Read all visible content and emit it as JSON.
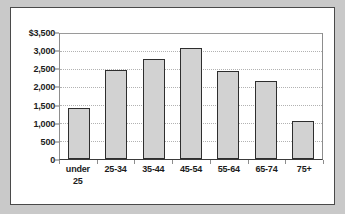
{
  "chart_data": {
    "type": "bar",
    "title": "",
    "subtitle": "",
    "xlabel": "",
    "ylabel": "",
    "categories": [
      "under 25",
      "25-34",
      "35-44",
      "45-54",
      "55-64",
      "65-74",
      "75+"
    ],
    "category_lines": [
      [
        "under",
        "25"
      ],
      [
        "25-34"
      ],
      [
        "35-44"
      ],
      [
        "45-54"
      ],
      [
        "55-64"
      ],
      [
        "65-74"
      ],
      [
        "75+"
      ]
    ],
    "values": [
      1400,
      2450,
      2750,
      3050,
      2425,
      2150,
      1050
    ],
    "ylim": [
      0,
      3500
    ],
    "ytick_values": [
      0,
      500,
      1000,
      1500,
      2000,
      2500,
      3000,
      3500
    ],
    "ytick_labels": [
      "0",
      "500",
      "1,000",
      "1,500",
      "2,000",
      "2,500",
      "3,000",
      "$3,500"
    ],
    "grid": true,
    "grid_orientation": "horizontal",
    "legend": false,
    "legend_position": "none",
    "bar_fill_color": "#d2d2d2",
    "bar_border_color": "#2e2e2e",
    "gridline_color": "#b2b2b2",
    "axis_color": "#3a3a3a",
    "panel_background": "#ffffff",
    "panel_border_color": "#4a4a4a",
    "page_background": "#c9c9c9",
    "text_color": "#1c1c1c"
  }
}
